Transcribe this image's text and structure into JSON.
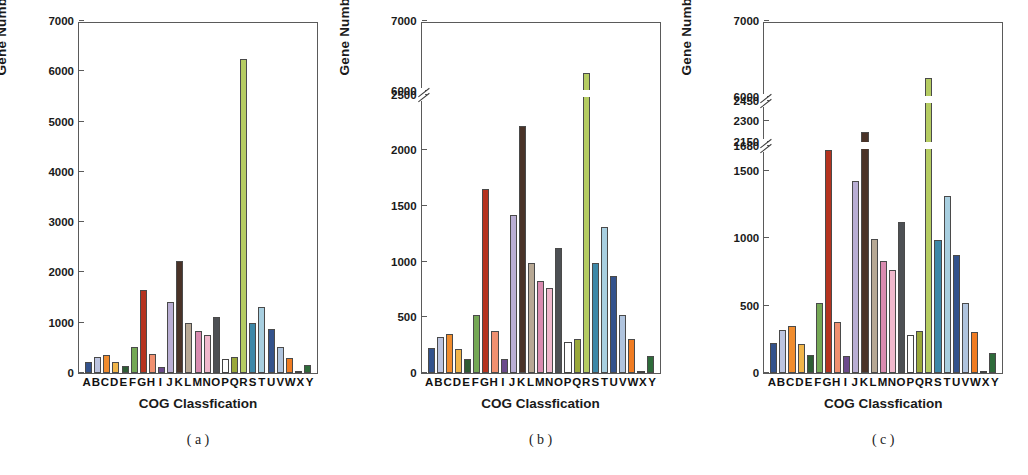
{
  "figure": {
    "categories": [
      "A",
      "B",
      "C",
      "D",
      "E",
      "F",
      "G",
      "H",
      "I",
      "J",
      "K",
      "L",
      "M",
      "N",
      "O",
      "P",
      "Q",
      "R",
      "S",
      "T",
      "U",
      "V",
      "W",
      "X",
      "Y"
    ],
    "bar_colors": [
      "#33528c",
      "#bcc4e0",
      "#f08c2e",
      "#f0b54a",
      "#2e5c34",
      "#75a855",
      "#b5331f",
      "#f09070",
      "#6b4a8c",
      "#b9aed4",
      "#4a3328",
      "#b7a894",
      "#d98bb0",
      "#f0b8cc",
      "#4d5054",
      "#ffffff",
      "#9aa83a",
      "#b5cc62",
      "#3d88a8",
      "#a8cfe0",
      "#33528c",
      "#b0c4de",
      "#f07c22",
      "#f5f5f5",
      "#2e6b3a"
    ],
    "xlabel": "COG Classfication",
    "ylabel": "Gene Number"
  },
  "chart_data": [
    {
      "type": "bar",
      "panel": "a",
      "caption": "( a )",
      "title": "",
      "xlabel": "COG Classfication",
      "ylabel": "Gene Number",
      "categories": [
        "A",
        "B",
        "C",
        "D",
        "E",
        "F",
        "G",
        "H",
        "I",
        "J",
        "K",
        "L",
        "M",
        "N",
        "O",
        "P",
        "Q",
        "R",
        "S",
        "T",
        "U",
        "V",
        "W",
        "X",
        "Y"
      ],
      "values": [
        225,
        320,
        350,
        215,
        130,
        520,
        1650,
        375,
        125,
        1420,
        2220,
        990,
        830,
        760,
        1120,
        280,
        310,
        6250,
        985,
        1310,
        875,
        520,
        305,
        10,
        150
      ],
      "ylim": [
        0,
        7000
      ],
      "yticks": [
        0,
        1000,
        2000,
        3000,
        4000,
        5000,
        6000,
        7000
      ],
      "ytick_labels": [
        "0",
        "1000",
        "2000",
        "3000",
        "4000",
        "5000",
        "6000",
        "7000"
      ],
      "axis_breaks": [],
      "grid": false,
      "legend": "none"
    },
    {
      "type": "bar",
      "panel": "b",
      "caption": "( b )",
      "title": "",
      "xlabel": "COG Classfication",
      "ylabel": "Gene Number",
      "categories": [
        "A",
        "B",
        "C",
        "D",
        "E",
        "F",
        "G",
        "H",
        "I",
        "J",
        "K",
        "L",
        "M",
        "N",
        "O",
        "P",
        "Q",
        "R",
        "S",
        "T",
        "U",
        "V",
        "W",
        "X",
        "Y"
      ],
      "values": [
        225,
        320,
        350,
        215,
        130,
        520,
        1650,
        375,
        125,
        1420,
        2220,
        990,
        830,
        760,
        1120,
        280,
        310,
        6250,
        985,
        1310,
        875,
        520,
        305,
        10,
        150
      ],
      "ylim": [
        0,
        7000
      ],
      "yticks": [
        0,
        500,
        1000,
        1500,
        2000,
        2500,
        6000,
        7000
      ],
      "ytick_labels": [
        "0",
        "500",
        "1000",
        "1500",
        "2000",
        "2500",
        "6000",
        "7000"
      ],
      "axis_breaks": [
        [
          2500,
          6000
        ]
      ],
      "grid": false,
      "legend": "none"
    },
    {
      "type": "bar",
      "panel": "c",
      "caption": "( c )",
      "title": "",
      "xlabel": "COG Classfication",
      "ylabel": "Gene Number",
      "categories": [
        "A",
        "B",
        "C",
        "D",
        "E",
        "F",
        "G",
        "H",
        "I",
        "J",
        "K",
        "L",
        "M",
        "N",
        "O",
        "P",
        "Q",
        "R",
        "S",
        "T",
        "U",
        "V",
        "W",
        "X",
        "Y"
      ],
      "values": [
        225,
        320,
        350,
        215,
        130,
        520,
        1650,
        375,
        125,
        1420,
        2220,
        990,
        830,
        760,
        1120,
        280,
        310,
        6250,
        985,
        1310,
        875,
        520,
        305,
        10,
        150
      ],
      "ylim": [
        0,
        7000
      ],
      "yticks": [
        0,
        500,
        1000,
        1500,
        1680,
        2150,
        2300,
        2450,
        6000,
        7000
      ],
      "ytick_labels": [
        "0",
        "500",
        "1000",
        "1500",
        "1680",
        "2150",
        "2300",
        "2450",
        "6000",
        "7000"
      ],
      "axis_breaks": [
        [
          1680,
          2150
        ],
        [
          2450,
          6000
        ]
      ],
      "grid": false,
      "legend": "none"
    }
  ]
}
